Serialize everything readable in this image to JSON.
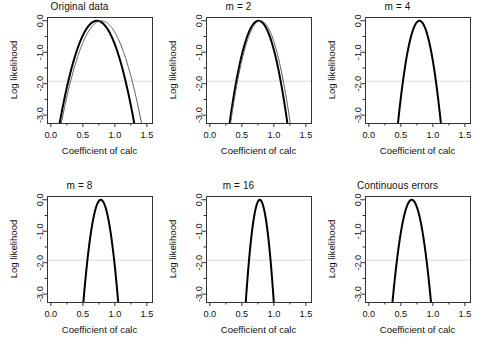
{
  "figure": {
    "layout": {
      "rows": 2,
      "cols": 3
    },
    "background": "#ffffff",
    "axis_color": "#333333",
    "curve_color_primary": "#000000",
    "curve_color_secondary": "#5a5a5a",
    "reference_line_color": "#d9d9d9"
  },
  "axes": {
    "xlabel": "Coefficient of calc",
    "ylabel": "Log likelihood",
    "xticks": [
      "0.0",
      "0.5",
      "1.0",
      "1.5"
    ],
    "xtick_values": [
      0.0,
      0.5,
      1.0,
      1.5
    ],
    "yticks": [
      "0.0",
      "-1.0",
      "-2.0",
      "-3.0"
    ],
    "ytick_values": [
      0.0,
      -1.0,
      -2.0,
      -3.0
    ],
    "xlim": [
      -0.06,
      1.58
    ],
    "ylim": [
      -3.25,
      0.12
    ],
    "minor_y_values": [
      -0.5,
      -1.5,
      -2.5
    ],
    "reference_line_y": -1.92
  },
  "chart_data": {
    "type": "line",
    "xlabel": "Coefficient of calc",
    "ylabel": "Log likelihood",
    "xlim": [
      -0.06,
      1.58
    ],
    "ylim": [
      -3.25,
      0.12
    ],
    "grid": false,
    "legend": "none",
    "annotations": [
      {
        "type": "hline",
        "y": -1.92,
        "label": "95% profile-likelihood cutoff"
      }
    ],
    "panels": [
      {
        "title": "Original data",
        "series": [
          {
            "name": "thick-black",
            "style": "thick",
            "peak_x": 0.72,
            "peak_y": 0.0,
            "curvature": 9.6,
            "ci_low": 0.4,
            "ci_high": 1.04,
            "x_at_minus3": [
              0.26,
              1.4
            ]
          },
          {
            "name": "thin-gray",
            "style": "thin",
            "peak_x": 0.79,
            "peak_y": 0.0,
            "curvature": 8.3,
            "ci_low": 0.43,
            "ci_high": 1.15,
            "x_at_minus3": [
              0.27,
              1.52
            ]
          }
        ]
      },
      {
        "title": "m = 2",
        "series": [
          {
            "name": "thick-black",
            "style": "thick",
            "peak_x": 0.76,
            "peak_y": 0.0,
            "curvature": 16.0,
            "ci_low": 0.52,
            "ci_high": 1.0,
            "x_at_minus3": [
              0.4,
              1.2
            ]
          },
          {
            "name": "thin-gray",
            "style": "thin",
            "peak_x": 0.79,
            "peak_y": 0.0,
            "curvature": 15.0,
            "ci_low": 0.54,
            "ci_high": 1.04,
            "x_at_minus3": [
              0.42,
              1.26
            ]
          }
        ]
      },
      {
        "title": "m = 4",
        "series": [
          {
            "name": "thick-black",
            "style": "thick",
            "peak_x": 0.79,
            "peak_y": 0.0,
            "curvature": 29.0,
            "ci_low": 0.61,
            "ci_high": 0.97,
            "x_at_minus3": [
              0.51,
              1.11
            ]
          }
        ]
      },
      {
        "title": "m = 8",
        "series": [
          {
            "name": "thick-black",
            "style": "thick",
            "peak_x": 0.78,
            "peak_y": 0.0,
            "curvature": 44.0,
            "ci_low": 0.64,
            "ci_high": 0.93,
            "x_at_minus3": [
              0.57,
              1.01
            ]
          }
        ]
      },
      {
        "title": "m = 16",
        "series": [
          {
            "name": "thick-black",
            "style": "thick",
            "peak_x": 0.78,
            "peak_y": 0.0,
            "curvature": 68.0,
            "ci_low": 0.67,
            "ci_high": 0.9,
            "x_at_minus3": [
              0.59,
              0.95
            ]
          }
        ]
      },
      {
        "title": "Continuous errors",
        "series": [
          {
            "name": "thick-black",
            "style": "thick",
            "peak_x": 0.67,
            "peak_y": 0.0,
            "curvature": 36.0,
            "ci_low": 0.44,
            "ci_high": 0.9,
            "x_at_minus3": [
              0.48,
              0.86
            ]
          }
        ]
      }
    ]
  }
}
